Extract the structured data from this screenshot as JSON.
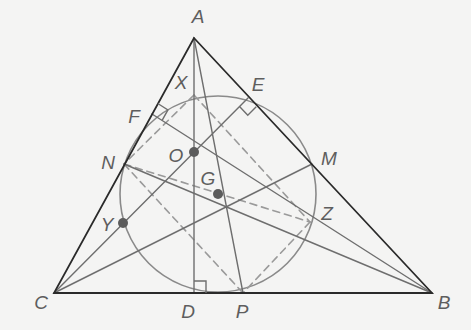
{
  "diagram": {
    "colors": {
      "background": "#f4f4f3",
      "triangle": "#2a2a2a",
      "construction": "#6e6e6e",
      "circle": "#8a8a8a",
      "dashed": "#9a9a9a",
      "point": "#5c5c5c",
      "label": "#5e5e5e"
    },
    "points": {
      "A": {
        "label": "A",
        "x": 194,
        "y": 38,
        "lx": 198,
        "ly": 16
      },
      "B": {
        "label": "B",
        "x": 432,
        "y": 293,
        "lx": 444,
        "ly": 302
      },
      "C": {
        "label": "C",
        "x": 54,
        "y": 293,
        "lx": 41,
        "ly": 302
      },
      "D": {
        "label": "D",
        "x": 194,
        "y": 293,
        "lx": 188,
        "ly": 311
      },
      "E": {
        "label": "E",
        "x": 248,
        "y": 98,
        "lx": 258,
        "ly": 84
      },
      "F": {
        "label": "F",
        "x": 152,
        "y": 114,
        "lx": 134,
        "ly": 116
      },
      "M": {
        "label": "M",
        "x": 312,
        "y": 164,
        "lx": 329,
        "ly": 158
      },
      "N": {
        "label": "N",
        "x": 124,
        "y": 164,
        "lx": 108,
        "ly": 162
      },
      "P": {
        "label": "P",
        "x": 243,
        "y": 293,
        "lx": 242,
        "ly": 311
      },
      "X": {
        "label": "X",
        "x": 194,
        "y": 95,
        "lx": 181,
        "ly": 82
      },
      "Y": {
        "label": "Y",
        "x": 123,
        "y": 223,
        "lx": 107,
        "ly": 224
      },
      "Z": {
        "label": "Z",
        "x": 310,
        "y": 222,
        "lx": 327,
        "ly": 213
      },
      "O": {
        "label": "O",
        "x": 194,
        "y": 152,
        "lx": 176,
        "ly": 155
      },
      "G": {
        "label": "G",
        "x": 218,
        "y": 194,
        "lx": 208,
        "ly": 178
      }
    },
    "circle": {
      "cx": 218,
      "cy": 194,
      "r": 98
    },
    "marked_points": [
      "O",
      "G",
      "Y"
    ],
    "right_angle_marks": [
      "D",
      "E",
      "F"
    ]
  }
}
